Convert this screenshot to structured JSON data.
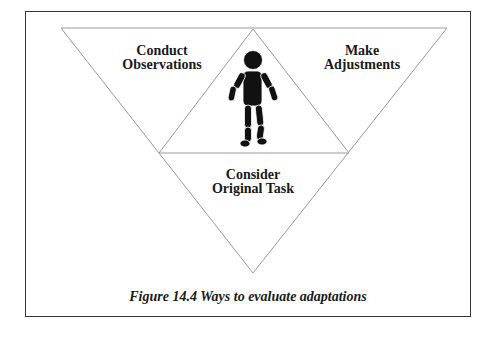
{
  "figure": {
    "caption": "Figure 14.4 Ways to evaluate adaptations",
    "labels": {
      "top_left": {
        "line1": "Conduct",
        "line2": "Observations"
      },
      "top_right": {
        "line1": "Make",
        "line2": "Adjustments"
      },
      "bottom": {
        "line1": "Consider",
        "line2": "Original Task"
      }
    },
    "center_icon": "person-figure-icon",
    "colors": {
      "frame": "#333333",
      "triangle_lines": "#9a9a9a",
      "text": "#1a1a1a",
      "figure": "#111111"
    }
  }
}
